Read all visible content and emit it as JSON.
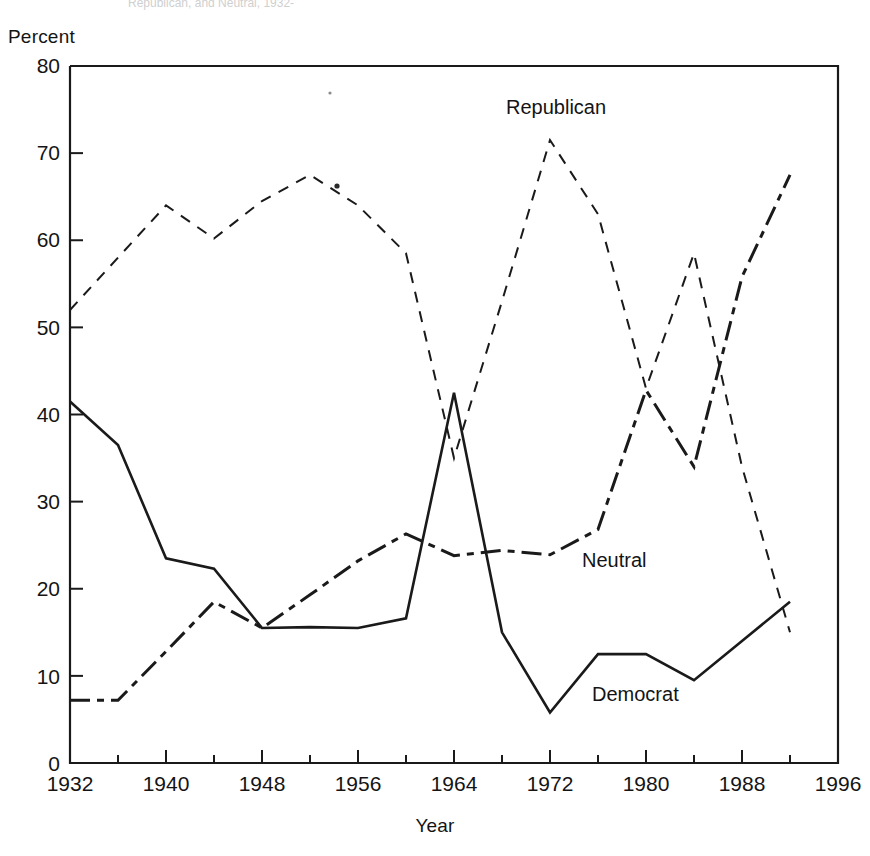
{
  "figure": {
    "partial_header": "Republican, and Neutral, 1932-",
    "ylabel": "Percent",
    "xlabel": "Year"
  },
  "chart_data": {
    "type": "line",
    "title": "",
    "xlabel": "Year",
    "ylabel": "Percent",
    "xlim": [
      1932,
      1996
    ],
    "ylim": [
      0,
      80
    ],
    "xticks": [
      1932,
      1940,
      1948,
      1956,
      1964,
      1972,
      1980,
      1988,
      1996
    ],
    "yticks": [
      0,
      10,
      20,
      30,
      40,
      50,
      60,
      70,
      80
    ],
    "minor_x_interval": 4,
    "grid": false,
    "legend": "inline-annotations",
    "x": [
      1932,
      1936,
      1940,
      1944,
      1948,
      1952,
      1956,
      1960,
      1964,
      1968,
      1972,
      1976,
      1980,
      1984,
      1988,
      1992
    ],
    "series": [
      {
        "name": "Republican",
        "style": "dashed",
        "label_position": [
          1968,
          76
        ],
        "values": [
          52.0,
          58.0,
          64.0,
          60.2,
          64.5,
          67.5,
          64.0,
          58.5,
          35.0,
          53.0,
          71.5,
          63.0,
          43.0,
          58.5,
          34.0,
          15.0
        ]
      },
      {
        "name": "Neutral",
        "style": "dash-dot",
        "label_position": [
          1975,
          22
        ],
        "values": [
          7.2,
          7.2,
          12.8,
          18.5,
          15.5,
          19.3,
          23.2,
          26.3,
          23.8,
          24.4,
          23.9,
          26.8,
          42.8,
          34.0,
          55.8,
          67.5
        ]
      },
      {
        "name": "Democrat",
        "style": "solid",
        "label_position": [
          1976,
          16
        ],
        "values": [
          41.5,
          36.5,
          23.5,
          22.3,
          15.5,
          15.6,
          15.5,
          16.6,
          42.5,
          15.0,
          5.8,
          12.5,
          12.5,
          9.5,
          14.0,
          18.5
        ]
      }
    ]
  },
  "axis": {
    "y_tick_labels": [
      "80",
      "70",
      "60",
      "50",
      "40",
      "30",
      "20",
      "10",
      "0"
    ],
    "x_tick_labels": [
      "1932",
      "1940",
      "1948",
      "1956",
      "1964",
      "1972",
      "1980",
      "1988",
      "1996"
    ]
  },
  "series_labels": {
    "republican": "Republican",
    "neutral": "Neutral",
    "democrat": "Democrat"
  }
}
